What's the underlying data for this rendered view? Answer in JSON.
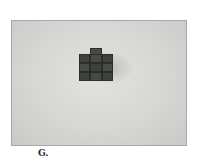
{
  "figure": {
    "caption": "G.",
    "structure": {
      "top_row_cubes": 1,
      "base_columns": 3,
      "base_rows": 3
    },
    "colors": {
      "background": "#ffffff",
      "plate": "#d6d6d4",
      "cube": "#3f413f"
    }
  }
}
